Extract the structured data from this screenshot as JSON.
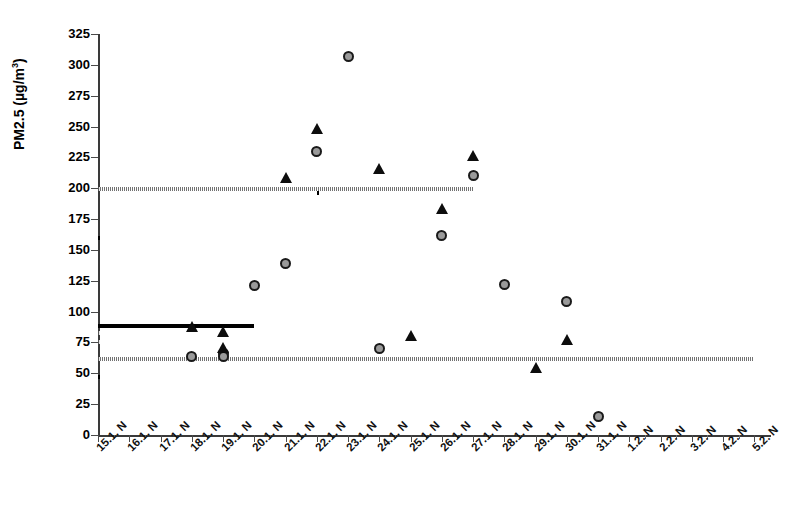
{
  "chart_data": {
    "type": "scatter",
    "title": "",
    "xlabel": "",
    "ylabel": "PM2.5 (µg/m³)",
    "ylabel_base": "PM2.5 (µg/m",
    "ylabel_sup": "3",
    "ylabel_close": ")",
    "ylim": [
      0,
      325
    ],
    "ytick_step": 25,
    "yticks": [
      0,
      25,
      50,
      75,
      100,
      125,
      150,
      175,
      200,
      225,
      250,
      275,
      300,
      325
    ],
    "grid": false,
    "legend": "none",
    "categories": [
      "15.1. N",
      "16.1. N",
      "17.1. N",
      "18.1. N",
      "19.1. N",
      "20.1. N",
      "21.1. N",
      "22.1. N",
      "23.1. N",
      "24.1. N",
      "25.1. N",
      "26.1. N",
      "27.1. N",
      "28.1. N",
      "29.1. N",
      "30.1. N",
      "31.1. N",
      "1.2. N",
      "2.2. N",
      "3.2. N",
      "4.2. N",
      "5.2. N"
    ],
    "series": [
      {
        "name": "circle-series",
        "marker": "circle-gray-filled",
        "points": [
          {
            "x": "18.1. N",
            "y": 64
          },
          {
            "x": "19.1. N",
            "y": 66
          },
          {
            "x": "19.1. N",
            "y": 64
          },
          {
            "x": "20.1. N",
            "y": 121
          },
          {
            "x": "21.1. N",
            "y": 139
          },
          {
            "x": "22.1. N",
            "y": 230
          },
          {
            "x": "23.1. N",
            "y": 307
          },
          {
            "x": "24.1. N",
            "y": 70
          },
          {
            "x": "26.1. N",
            "y": 162
          },
          {
            "x": "27.1. N",
            "y": 210
          },
          {
            "x": "28.1. N",
            "y": 122
          },
          {
            "x": "30.1. N",
            "y": 108
          },
          {
            "x": "31.1. N",
            "y": 15
          }
        ]
      },
      {
        "name": "triangle-series",
        "marker": "triangle-black-filled",
        "points": [
          {
            "x": "18.1. N",
            "y": 88
          },
          {
            "x": "19.1. N",
            "y": 84
          },
          {
            "x": "19.1. N",
            "y": 71
          },
          {
            "x": "21.1. N",
            "y": 209
          },
          {
            "x": "22.1. N",
            "y": 249
          },
          {
            "x": "24.1. N",
            "y": 216
          },
          {
            "x": "25.1. N",
            "y": 81
          },
          {
            "x": "26.1. N",
            "y": 184
          },
          {
            "x": "27.1. N",
            "y": 227
          },
          {
            "x": "29.1. N",
            "y": 55
          },
          {
            "x": "30.1. N",
            "y": 78
          }
        ]
      }
    ],
    "mean_segments": [
      {
        "style": "solid-black",
        "value": 88,
        "x_start": "15.1. N",
        "x_end": "20.1. N"
      },
      {
        "style": "dotted-gray",
        "value": 75,
        "x_start": "15.5",
        "x_end": "20.5"
      },
      {
        "style": "solid-black",
        "value": 196,
        "x_start": "22.1. N",
        "x_end": "26.6"
      },
      {
        "style": "dotted-gray",
        "value": 199,
        "x_start": "22.3",
        "x_end": "27.1. N"
      },
      {
        "style": "solid-black",
        "value": 160,
        "x_start": "27.6",
        "x_end": "29.0"
      },
      {
        "style": "dotted-gray",
        "value": 83,
        "x_start": "28.2",
        "x_end": "29.2"
      },
      {
        "style": "dotted-gray",
        "value": 62,
        "x_start": "30.8",
        "x_end": "5.2. N"
      },
      {
        "style": "solid-black",
        "value": 47,
        "x_start": "31.3",
        "x_end": "4.7"
      }
    ],
    "colors": {
      "marker_circle_fill": "#9a9a9a",
      "marker_circle_stroke": "#1a1a1a",
      "marker_triangle_fill": "#0d0d0d",
      "segment_solid": "#000000",
      "segment_dotted": "#5a5a5a",
      "axis": "#3a3a3a",
      "background": "#ffffff"
    }
  }
}
